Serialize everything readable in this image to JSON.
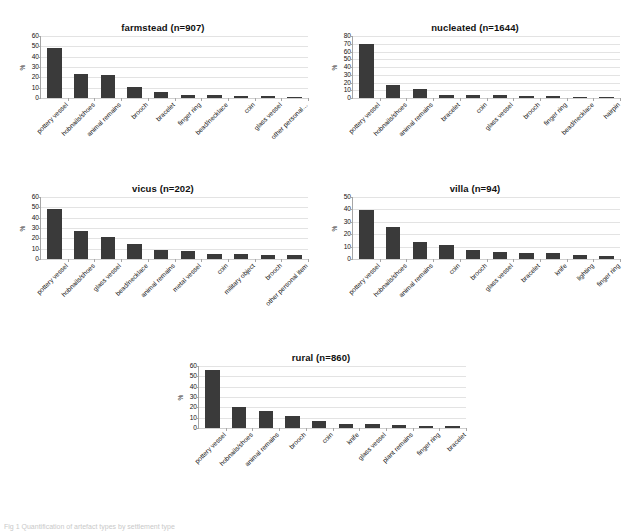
{
  "figure": {
    "caption_partial": "Fig 1 Quantification of artefact types by settlement type"
  },
  "axis_label": "%",
  "chart_data": [
    {
      "id": "farmstead",
      "type": "bar",
      "title": "farmstead  (n=907)",
      "xlabel": "",
      "ylabel": "%",
      "ylim": [
        0,
        60
      ],
      "yticks": [
        0,
        10,
        20,
        30,
        40,
        50,
        60
      ],
      "grid": true,
      "categories": [
        "pottery vessel",
        "hobnails/shoes",
        "animal remains",
        "brooch",
        "bracelet",
        "finger ring",
        "bead/necklace",
        "coin",
        "glass vessel",
        "other personal…"
      ],
      "values": [
        48.5,
        23.5,
        22,
        11,
        5.5,
        3,
        2.5,
        2,
        2,
        1
      ]
    },
    {
      "id": "nucleated",
      "type": "bar",
      "title": "nucleated (n=1644)",
      "xlabel": "",
      "ylabel": "%",
      "ylim": [
        0,
        80
      ],
      "yticks": [
        0,
        10,
        20,
        30,
        40,
        50,
        60,
        70,
        80
      ],
      "grid": true,
      "categories": [
        "pottery vessel",
        "hobnails/shoes",
        "animal remains",
        "bracelet",
        "coin",
        "glass vessel",
        "brooch",
        "finger ring",
        "bead/necklace",
        "hairpin"
      ],
      "values": [
        69.5,
        16.5,
        12,
        4,
        3.8,
        3.6,
        3,
        2,
        1.2,
        1
      ]
    },
    {
      "id": "vicus",
      "type": "bar",
      "title": "vicus (n=202)",
      "xlabel": "",
      "ylabel": "%",
      "ylim": [
        0,
        60
      ],
      "yticks": [
        0,
        10,
        20,
        30,
        40,
        50,
        60
      ],
      "grid": true,
      "categories": [
        "pottery vessel",
        "hobnails/shoes",
        "glass vessel",
        "bead/necklace",
        "animal remains",
        "metal vessel",
        "coin",
        "military object",
        "brooch",
        "other personal item"
      ],
      "values": [
        48,
        27.5,
        21.5,
        15,
        9,
        8,
        5,
        5,
        4.2,
        4
      ]
    },
    {
      "id": "villa",
      "type": "bar",
      "title": "villa (n=94)",
      "xlabel": "",
      "ylabel": "%",
      "ylim": [
        0,
        50
      ],
      "yticks": [
        0,
        10,
        20,
        30,
        40,
        50
      ],
      "grid": true,
      "categories": [
        "pottery vessel",
        "hobnails/shoes",
        "animal remains",
        "coin",
        "brooch",
        "glass vessel",
        "bracelet",
        "knife",
        "lighting",
        "finger ring"
      ],
      "values": [
        39.5,
        25.5,
        14,
        11.5,
        7.2,
        6,
        5,
        5,
        3.6,
        2.2
      ]
    },
    {
      "id": "rural",
      "type": "bar",
      "title": "rural (n=860)",
      "xlabel": "",
      "ylabel": "%",
      "ylim": [
        0,
        60
      ],
      "yticks": [
        0,
        10,
        20,
        30,
        40,
        50,
        60
      ],
      "grid": true,
      "categories": [
        "pottery vessel",
        "hobnails/shoes",
        "animal remains",
        "brooch",
        "coin",
        "knife",
        "glass vessel",
        "plant remains",
        "finger ring",
        "bracelet"
      ],
      "values": [
        56.5,
        20,
        16,
        12,
        7,
        4.2,
        4,
        3,
        2,
        1.6
      ]
    }
  ]
}
